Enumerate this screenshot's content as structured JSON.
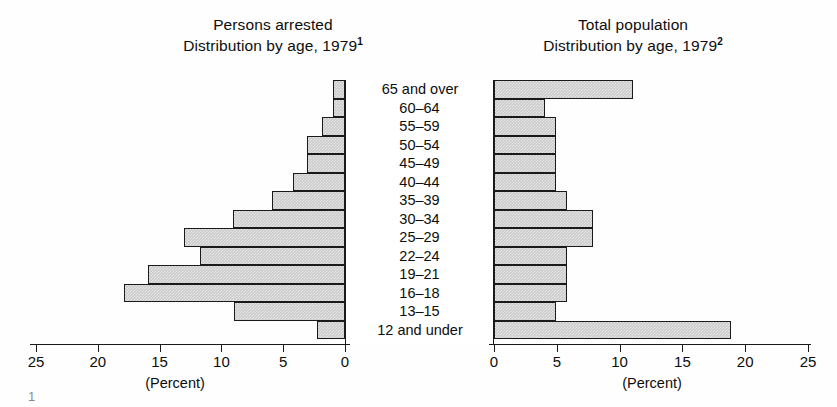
{
  "panels": {
    "left": {
      "title_line1": "Persons arrested",
      "title_line2": "Distribution by age, 1979",
      "title_footnote": "1",
      "axis_caption": "(Percent)"
    },
    "right": {
      "title_line1": "Total population",
      "title_line2": "Distribution by age, 1979",
      "title_footnote": "2",
      "axis_caption": "(Percent)"
    }
  },
  "axis": {
    "left_ticks": [
      "25",
      "20",
      "15",
      "10",
      "5",
      "0"
    ],
    "right_ticks": [
      "0",
      "5",
      "10",
      "15",
      "20",
      "25"
    ],
    "max": 25,
    "footnote_mark": "1"
  },
  "style": {
    "bar_fill": "#c9c9c9",
    "bar_border": "#1a1a1a",
    "text_color": "#0d0d0d",
    "background": "#ffffff"
  },
  "chart_data": {
    "type": "bar",
    "orientation": "horizontal",
    "layout": "population-pyramid (back-to-back bars)",
    "xlabel": "(Percent)",
    "ylabel": "",
    "xlim": [
      0,
      25
    ],
    "grid": false,
    "legend": "none",
    "categories": [
      "65 and over",
      "60–64",
      "55–59",
      "50–54",
      "45–49",
      "40–44",
      "35–39",
      "30–34",
      "25–29",
      "22–24",
      "19–21",
      "16–18",
      "13–15",
      "12 and under"
    ],
    "series": [
      {
        "name": "Persons arrested",
        "side": "left",
        "units": "percent",
        "values": [
          1.0,
          1.0,
          1.9,
          3.1,
          3.1,
          4.2,
          5.9,
          9.1,
          13.0,
          11.7,
          15.9,
          17.9,
          9.0,
          2.3
        ]
      },
      {
        "name": "Total population",
        "side": "right",
        "units": "percent",
        "values": [
          11.1,
          4.1,
          4.9,
          4.9,
          4.9,
          4.9,
          5.8,
          7.9,
          7.9,
          5.8,
          5.8,
          5.8,
          4.9,
          18.9
        ]
      }
    ]
  }
}
